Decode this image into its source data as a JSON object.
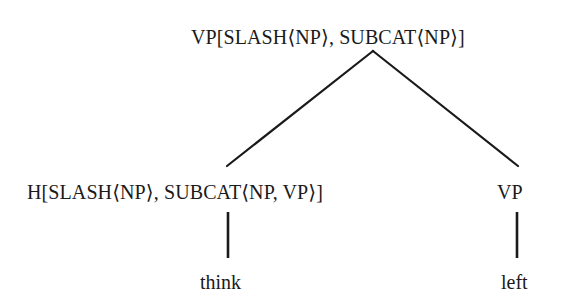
{
  "tree": {
    "root": {
      "label": "VP[SLASH⟨NP⟩, SUBCAT⟨NP⟩]"
    },
    "children": [
      {
        "label": "H[SLASH⟨NP⟩, SUBCAT⟨NP, VP⟩]",
        "leaf": "think"
      },
      {
        "label": "VP",
        "leaf": "left"
      }
    ]
  },
  "colors": {
    "line": "#1a1a1a",
    "text": "#1a1a1a",
    "background": "#ffffff"
  }
}
